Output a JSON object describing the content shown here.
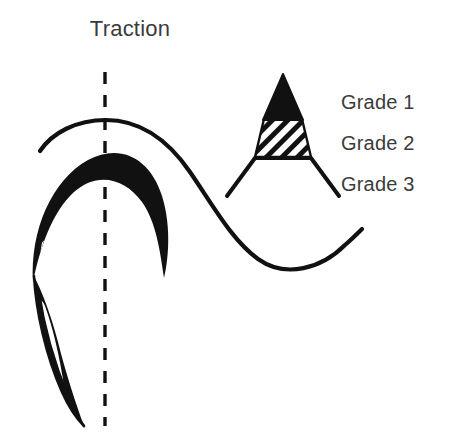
{
  "figure": {
    "title": "Traction",
    "background_color": "#ffffff",
    "ink_color": "#111111",
    "text_color": "#3b3b3b"
  },
  "legend": {
    "items": [
      {
        "label": "Grade 1",
        "fill": "solid-black"
      },
      {
        "label": "Grade 2",
        "fill": "diagonal-hatch"
      },
      {
        "label": "Grade 3",
        "fill": "white-open"
      }
    ]
  },
  "key_symbol": {
    "name": "grade-triangle-key",
    "description": "Triangle with solid black apex, diagonally hatched middle band, and open splayed legs below the base line",
    "apex": {
      "x": 283,
      "y": 74
    },
    "base_y": 158,
    "band_top_y": 119,
    "leg_bottom_y": 196
  },
  "anatomy": {
    "traction_axis": {
      "name": "traction-dashed-axis",
      "x": 105,
      "y_start": 72,
      "y_end": 426,
      "style": "dashed"
    },
    "outer_curve": {
      "name": "outer-s-curve",
      "description": "Thin S-shaped outline arcing over the crescent then sweeping down and right into a valley"
    },
    "crescent": {
      "name": "crescent-lesion",
      "description": "Thick black crescent (Grade 1) with a band of white diagonal hatch stripes (Grade 2) along its inner border"
    },
    "tail": {
      "name": "lower-tail-sliver",
      "description": "Narrow elongated sliver descending from the crescent with an inner white lens"
    }
  }
}
